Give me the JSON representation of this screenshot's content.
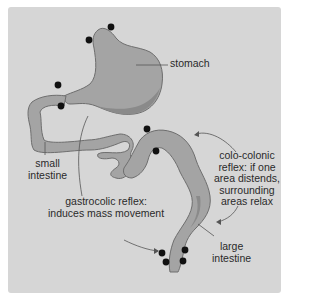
{
  "diagram": {
    "colors": {
      "background": "#d6d6d6",
      "organ_fill": "#a4a4a4",
      "organ_shadow": "#8a8a8a",
      "organ_outline": "#6e6e6e",
      "dot": "#111111",
      "leader_line": "#555555"
    },
    "labels": {
      "stomach": "stomach",
      "small_intestine_line1": "small",
      "small_intestine_line2": "intestine",
      "gastrocolic_line1": "gastrocolic reflex:",
      "gastrocolic_line2": "induces mass movement",
      "colocolonic_line1": "colo-colonic",
      "colocolonic_line2": "reflex: if one",
      "colocolonic_line3": "area distends,",
      "colocolonic_line4": "surrounding",
      "colocolonic_line5": "areas relax",
      "large_intestine_line1": "large",
      "large_intestine_line2": "intestine"
    }
  }
}
